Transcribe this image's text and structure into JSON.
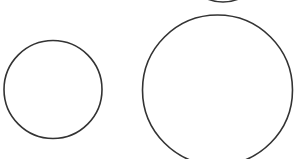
{
  "canvas": {
    "width": 299,
    "height": 159,
    "background": "#ffffff"
  },
  "style": {
    "stroke": "#333333",
    "stroke_width": 1.6,
    "fill": "none"
  },
  "shapes": [
    {
      "id": "top-partial-circle",
      "type": "circle",
      "cx": 223,
      "cy": -38,
      "r": 40,
      "note": "bottom arc of circle mostly out of frame"
    },
    {
      "id": "small-circle",
      "type": "circle",
      "cx": 53,
      "cy": 89.5,
      "r": 49
    },
    {
      "id": "large-circle",
      "type": "circle",
      "cx": 217.5,
      "cy": 90,
      "r": 75
    }
  ]
}
